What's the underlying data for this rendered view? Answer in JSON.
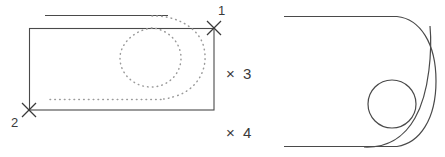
{
  "drawing": {
    "title": "technical-line-drawing",
    "stroke_color": "#4a4a4a",
    "dotted_color": "#8c8c8c",
    "background": "#ffffff",
    "stroke_width": 1
  },
  "markers": [
    {
      "id": "marker-1",
      "label": "1",
      "glyph": "×",
      "x": 214,
      "y": 28
    },
    {
      "id": "marker-2",
      "label": "2",
      "glyph": "×",
      "x": 29,
      "y": 110
    },
    {
      "id": "marker-3",
      "label": "3",
      "glyph": "×",
      "x": 234,
      "y": 74
    },
    {
      "id": "marker-4",
      "label": "4",
      "glyph": "×",
      "x": 234,
      "y": 133
    }
  ],
  "marker_text": {
    "one": "1",
    "two": "2",
    "three": "× 3",
    "four": "× 4"
  },
  "shapes": {
    "rectangle": {
      "name": "main-rectangle",
      "x": 29,
      "y": 28,
      "width": 185,
      "height": 82
    },
    "top_line": {
      "name": "upper-reference-line",
      "x1": 45,
      "y1": 15,
      "x2": 168,
      "y2": 15
    },
    "dotted_spiral": {
      "name": "dotted-spiral-path",
      "center_x": 160,
      "center_y": 57,
      "outer_radius": 44,
      "inner_radius": 30
    },
    "dotted_baseline": {
      "name": "dotted-lower-line",
      "x1": 50,
      "y1": 99,
      "x2": 163,
      "y2": 99
    },
    "nose_profile": {
      "name": "rounded-nose-profile",
      "top_line_x1": 284,
      "top_line_y": 16,
      "bottom_line_x1": 284,
      "bottom_line_y": 146,
      "nose_tip_x": 436,
      "corner_x": 397
    },
    "inner_circle": {
      "name": "inner-circle",
      "cx": 392,
      "cy": 104,
      "r": 24
    },
    "inner_arc": {
      "name": "inner-fillet-arc",
      "radius": 41
    }
  }
}
